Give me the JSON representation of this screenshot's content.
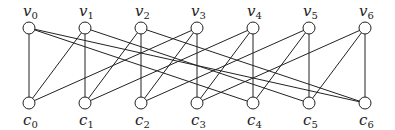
{
  "diagram": {
    "type": "bipartite-graph",
    "top_nodes": [
      {
        "id": "v0",
        "base": "v",
        "sub": "0",
        "x": 29
      },
      {
        "id": "v1",
        "base": "v",
        "sub": "1",
        "x": 85
      },
      {
        "id": "v2",
        "base": "v",
        "sub": "2",
        "x": 141
      },
      {
        "id": "v3",
        "base": "v",
        "sub": "3",
        "x": 197
      },
      {
        "id": "v4",
        "base": "v",
        "sub": "4",
        "x": 253
      },
      {
        "id": "v5",
        "base": "v",
        "sub": "5",
        "x": 309
      },
      {
        "id": "v6",
        "base": "v",
        "sub": "6",
        "x": 365
      }
    ],
    "bottom_nodes": [
      {
        "id": "c0",
        "base": "c",
        "sub": "0",
        "x": 29
      },
      {
        "id": "c1",
        "base": "c",
        "sub": "1",
        "x": 85
      },
      {
        "id": "c2",
        "base": "c",
        "sub": "2",
        "x": 141
      },
      {
        "id": "c3",
        "base": "c",
        "sub": "3",
        "x": 197
      },
      {
        "id": "c4",
        "base": "c",
        "sub": "4",
        "x": 253
      },
      {
        "id": "c5",
        "base": "c",
        "sub": "5",
        "x": 309
      },
      {
        "id": "c6",
        "base": "c",
        "sub": "6",
        "x": 365
      }
    ],
    "top_y": 28,
    "bottom_y": 103,
    "node_radius": 6,
    "edges": [
      [
        "v0",
        "c0"
      ],
      [
        "v1",
        "c0"
      ],
      [
        "v3",
        "c0"
      ],
      [
        "v1",
        "c1"
      ],
      [
        "v2",
        "c1"
      ],
      [
        "v4",
        "c1"
      ],
      [
        "v2",
        "c2"
      ],
      [
        "v3",
        "c2"
      ],
      [
        "v5",
        "c2"
      ],
      [
        "v3",
        "c3"
      ],
      [
        "v4",
        "c3"
      ],
      [
        "v6",
        "c3"
      ],
      [
        "v4",
        "c4"
      ],
      [
        "v5",
        "c4"
      ],
      [
        "v0",
        "c4"
      ],
      [
        "v5",
        "c5"
      ],
      [
        "v6",
        "c5"
      ],
      [
        "v1",
        "c5"
      ],
      [
        "v6",
        "c6"
      ],
      [
        "v0",
        "c6"
      ],
      [
        "v2",
        "c6"
      ]
    ]
  }
}
